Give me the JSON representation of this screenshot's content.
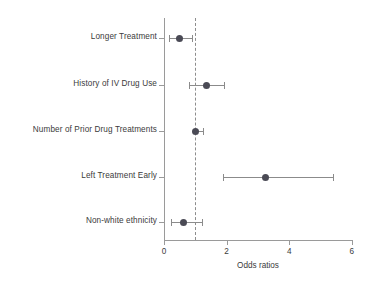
{
  "chart_data": {
    "type": "scatter",
    "subtype": "forest-plot",
    "title": "",
    "xlabel": "Odds ratios",
    "ylabel": "",
    "xlim": [
      0,
      6.25
    ],
    "xticks": [
      0,
      2,
      4,
      6
    ],
    "xtick_labels": [
      "0",
      "2",
      "4",
      "6"
    ],
    "grid": false,
    "legend": null,
    "reference_line": {
      "value": 1,
      "style": "dashed",
      "color": "#8d8d8d"
    },
    "categories": [
      "Longer Treatment",
      "History of IV Drug Use",
      "Number of Prior Drug Treatments",
      "Left Treatment Early",
      "Non-white ethnicity"
    ],
    "values": [
      0.48,
      1.37,
      1.02,
      3.25,
      0.62
    ],
    "ci_low": [
      0.17,
      0.8,
      0.98,
      1.87,
      0.21
    ],
    "ci_high": [
      0.9,
      1.92,
      1.25,
      5.4,
      1.22
    ],
    "points": [
      {
        "label": "Longer Treatment",
        "or": 0.48,
        "ci_low": 0.17,
        "ci_high": 0.9
      },
      {
        "label": "History of IV Drug Use",
        "or": 1.37,
        "ci_low": 0.8,
        "ci_high": 1.92
      },
      {
        "label": "Number of Prior Drug Treatments",
        "or": 1.02,
        "ci_low": 0.98,
        "ci_high": 1.25
      },
      {
        "label": "Left Treatment Early",
        "or": 3.25,
        "ci_low": 1.87,
        "ci_high": 5.4
      },
      {
        "label": "Non-white ethnicity",
        "or": 0.62,
        "ci_low": 0.21,
        "ci_high": 1.22
      }
    ],
    "colors": {
      "marker": "#4a4a55",
      "interval": "#8b8b8b",
      "axis": "#9a9a9a",
      "text": "#3b3b3b",
      "background": "#ffffff"
    }
  }
}
